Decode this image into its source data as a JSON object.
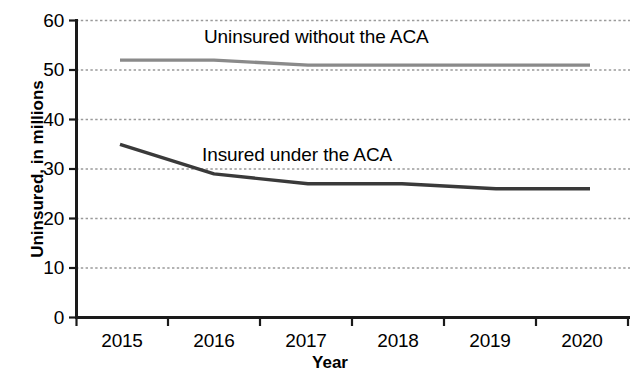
{
  "chart_data": {
    "type": "line",
    "title": "",
    "xlabel": "Year",
    "ylabel": "Uninsured, in millions",
    "categories": [
      "2015",
      "2016",
      "2017",
      "2018",
      "2019",
      "2020"
    ],
    "x": [
      2015,
      2016,
      2017,
      2018,
      2019,
      2020
    ],
    "ylim": [
      0,
      60
    ],
    "xlim": [
      2015,
      2020
    ],
    "yticks": [
      0,
      10,
      20,
      30,
      40,
      50,
      60
    ],
    "ytick_labels": [
      "0",
      "10",
      "20",
      "30",
      "40",
      "50",
      "60"
    ],
    "xtick_labels": [
      "2015",
      "2016",
      "2017",
      "2018",
      "2019",
      "2020"
    ],
    "grid": true,
    "grid_style": "dotted-horizontal",
    "legend": "inline-annotations",
    "series": [
      {
        "name": "Uninsured without the ACA",
        "color": "#8a8a8a",
        "values": [
          52,
          52,
          51,
          51,
          51,
          51
        ]
      },
      {
        "name": "Insured under the ACA",
        "color": "#3a3a3a",
        "values": [
          35,
          29,
          27,
          27,
          26,
          26
        ]
      }
    ],
    "annotations": [
      {
        "text": "Uninsured without the ACA",
        "near_series": "Uninsured without the ACA"
      },
      {
        "text": "Insured under the ACA",
        "near_series": "Insured under the ACA"
      }
    ]
  },
  "axes": {
    "y_title": "Uninsured, in millions",
    "x_title": "Year",
    "y_ticks": [
      {
        "label": "60"
      },
      {
        "label": "50"
      },
      {
        "label": "40"
      },
      {
        "label": "30"
      },
      {
        "label": "20"
      },
      {
        "label": "10"
      },
      {
        "label": "0"
      }
    ],
    "x_ticks": [
      {
        "label": "2015"
      },
      {
        "label": "2016"
      },
      {
        "label": "2017"
      },
      {
        "label": "2018"
      },
      {
        "label": "2019"
      },
      {
        "label": "2020"
      }
    ]
  },
  "colors": {
    "series_upper": "#8a8a8a",
    "series_lower": "#3a3a3a",
    "axis": "#1a1a1a",
    "grid": "#9a9a9a",
    "background": "#ffffff"
  }
}
